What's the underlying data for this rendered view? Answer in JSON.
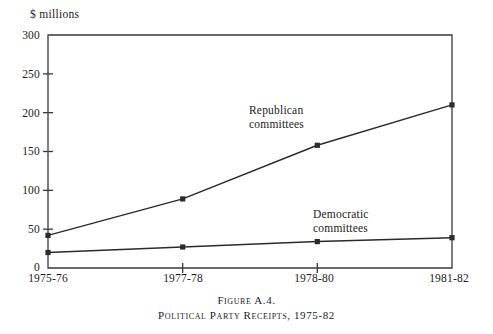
{
  "figure": {
    "caption_line1": "Figure A.4.",
    "caption_line2": "Political Party Receipts, 1975-82"
  },
  "chart_data": {
    "type": "line",
    "title": "Political Party Receipts, 1975-82",
    "xlabel": "",
    "ylabel": "$ millions",
    "unit_label": "$ millions",
    "categories": [
      "1975-76",
      "1977-78",
      "1978-80",
      "1981-82"
    ],
    "series": [
      {
        "name": "Republican committees",
        "label_line1": "Republican",
        "label_line2": "committees",
        "values": [
          42,
          89,
          158,
          210
        ],
        "color": "#2b2b2b"
      },
      {
        "name": "Democratic committees",
        "label_line1": "Democratic",
        "label_line2": "committees",
        "values": [
          20,
          27,
          34,
          39
        ],
        "color": "#2b2b2b"
      }
    ],
    "ylim": [
      0,
      300
    ],
    "yticks": [
      0,
      50,
      100,
      150,
      200,
      250,
      300
    ],
    "ytick_labels": [
      "0",
      "50",
      "100",
      "150",
      "200",
      "250",
      "300"
    ],
    "grid": false,
    "legend": "inline-annotations",
    "axis_color": "#3a3a3a",
    "background": "#ffffff"
  }
}
